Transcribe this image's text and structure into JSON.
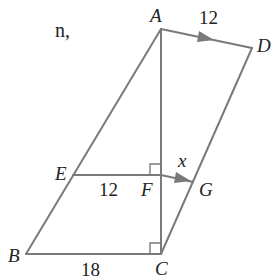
{
  "caption_fragment": "n,",
  "figure": {
    "type": "geometry",
    "points": {
      "A": {
        "label": "A"
      },
      "B": {
        "label": "B"
      },
      "C": {
        "label": "C"
      },
      "D": {
        "label": "D"
      },
      "E": {
        "label": "E"
      },
      "F": {
        "label": "F"
      },
      "G": {
        "label": "G"
      }
    },
    "measures": {
      "AD": "12",
      "EF": "12",
      "FG": "x",
      "BC": "18"
    },
    "annotations": {
      "parallel_marks": [
        "AD",
        "FG"
      ],
      "right_angles": [
        "F",
        "C"
      ]
    },
    "stroke_color": "#7a7a7a",
    "text_color": "#222222"
  }
}
